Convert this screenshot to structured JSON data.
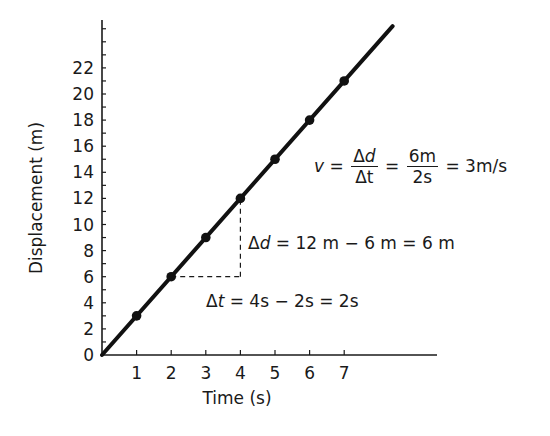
{
  "chart_data": {
    "type": "line",
    "title": "",
    "xlabel": "Time (s)",
    "ylabel": "Displacement (m)",
    "x": [
      0,
      1,
      2,
      3,
      4,
      5,
      6,
      7
    ],
    "series": [
      {
        "name": "displacement",
        "values": [
          0,
          3,
          6,
          9,
          12,
          15,
          18,
          21
        ],
        "color": "#111111"
      }
    ],
    "markers_at": [
      1,
      2,
      3,
      4,
      5,
      6,
      7
    ],
    "line_extends_to": {
      "x": 8.4,
      "y": 25.2
    },
    "xticks": [
      "1",
      "2",
      "3",
      "4",
      "5",
      "6",
      "7"
    ],
    "yticks": [
      "0",
      "2",
      "4",
      "6",
      "8",
      "10",
      "12",
      "14",
      "16",
      "18",
      "20",
      "22"
    ],
    "xlim": [
      0,
      9.6
    ],
    "ylim": [
      0,
      25.5
    ],
    "y_minor_tick_step": 1,
    "grid": false,
    "legend": null,
    "annotations": [
      {
        "type": "slope-triangle",
        "from": [
          2,
          6
        ],
        "to": [
          4,
          12
        ],
        "style": "dashed"
      },
      {
        "type": "text",
        "id": "velocity",
        "text": "v = Δd/Δt = 6m/2s = 3m/s"
      },
      {
        "type": "text",
        "id": "delta_d",
        "text": "Δd = 12 m − 6 m = 6 m"
      },
      {
        "type": "text",
        "id": "delta_t",
        "text": "Δt = 4s − 2s = 2s"
      }
    ]
  },
  "labels": {
    "xlabel": "Time (s)",
    "ylabel": "Displacement (m)",
    "yticks": [
      "0",
      "2",
      "4",
      "6",
      "8",
      "10",
      "12",
      "14",
      "16",
      "18",
      "20",
      "22"
    ],
    "xticks": [
      "1",
      "2",
      "3",
      "4",
      "5",
      "6",
      "7"
    ]
  },
  "equations": {
    "velocity": {
      "lhs": "v",
      "eq1": "=",
      "frac1_num_delta": "Δ",
      "frac1_num_var": "d",
      "frac1_den": "Δt",
      "eq2": "=",
      "frac2_num": "6m",
      "frac2_den": "2s",
      "rhs": "= 3m/s"
    },
    "delta_d": {
      "symbol": "Δ",
      "var": "d",
      "expr": " = 12 m − 6 m = 6 m"
    },
    "delta_t": {
      "symbol": "Δ",
      "var": "t",
      "expr": " = 4s − 2s = 2s"
    }
  }
}
